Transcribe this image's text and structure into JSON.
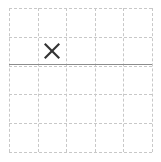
{
  "diagram": {
    "type": "grid",
    "width": 161,
    "height": 162,
    "background_color": "#ffffff",
    "grid": {
      "columns": 5,
      "rows": 5,
      "origin_x": 9,
      "origin_y": 8,
      "cell_width": 28.6,
      "cell_height": 28.8,
      "line_color": "#c8c8c8",
      "line_style": "dashed",
      "line_width": 1,
      "x_positions": [
        9,
        37.6,
        66.2,
        94.8,
        123.4,
        152
      ],
      "y_positions": [
        8,
        36.8,
        65.6,
        94.4,
        123.2,
        152
      ]
    },
    "emphasis_line": {
      "orientation": "horizontal",
      "y": 64,
      "x_start": 9,
      "x_end": 152,
      "color": "#8c8c8c",
      "style": "solid",
      "line_width": 1,
      "label": "boundary-line"
    },
    "marks": [
      {
        "glyph": "x-mark",
        "symbol": "×",
        "column": 2,
        "row": 2,
        "center_x": 52,
        "center_y": 51,
        "size": 17,
        "color": "#333333"
      }
    ]
  }
}
